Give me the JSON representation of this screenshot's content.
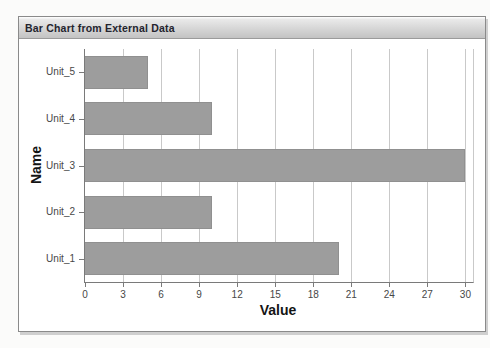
{
  "panel": {
    "title": "Bar Chart from External Data"
  },
  "chart_data": {
    "type": "bar",
    "orientation": "horizontal",
    "title": "Bar Chart from External Data",
    "xlabel": "Value",
    "ylabel": "Name",
    "categories": [
      "Unit_5",
      "Unit_4",
      "Unit_3",
      "Unit_2",
      "Unit_1"
    ],
    "values": [
      5,
      10,
      30,
      10,
      20
    ],
    "xticks": [
      0,
      3,
      6,
      9,
      12,
      15,
      18,
      21,
      24,
      27,
      30
    ],
    "xlim": [
      0,
      30.6
    ],
    "grid": "vertical",
    "legend": "none",
    "bar_color": "#9d9d9d"
  },
  "colors": {
    "header_text": "#24242e",
    "bar_fill": "#9d9d9d",
    "bar_edge": "#909090",
    "grid": "#c9c9c9",
    "axis": "#7a7a7a",
    "tick_label": "#474747",
    "axis_title": "#141414",
    "panel_border": "#8a8a8a"
  }
}
